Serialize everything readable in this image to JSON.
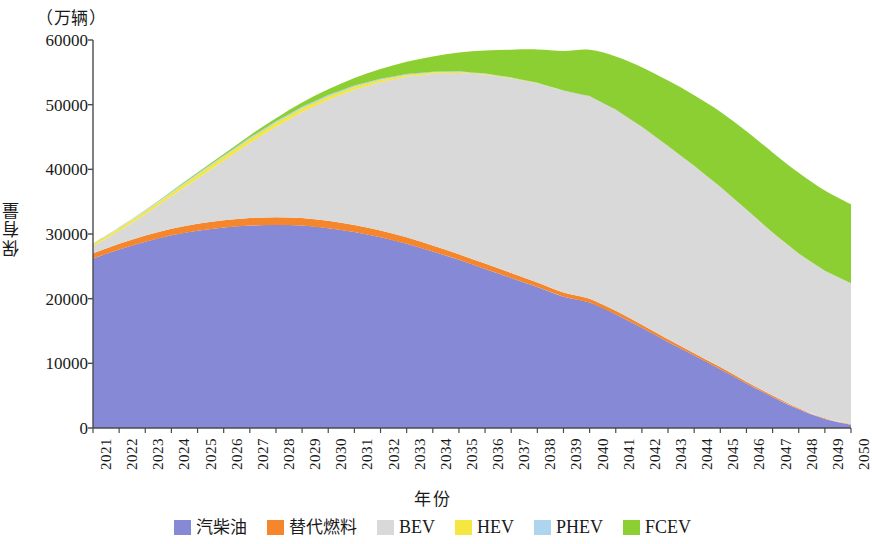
{
  "chart_data": {
    "type": "area",
    "stacked": true,
    "title": "",
    "unit_note": "（万辆）",
    "xlabel": "年份",
    "ylabel": "保有量",
    "ylim": [
      0,
      60000
    ],
    "ytick_labels": [
      "0",
      "10000",
      "20000",
      "30000",
      "40000",
      "50000",
      "60000"
    ],
    "ytick_values": [
      0,
      10000,
      20000,
      30000,
      40000,
      50000,
      60000
    ],
    "grid": false,
    "legend_position": "bottom",
    "categories": [
      "2021",
      "2022",
      "2023",
      "2024",
      "2025",
      "2026",
      "2027",
      "2028",
      "2029",
      "2030",
      "2031",
      "2032",
      "2033",
      "2034",
      "2035",
      "2036",
      "2037",
      "2038",
      "2039",
      "2040",
      "2041",
      "2042",
      "2043",
      "2044",
      "2045",
      "2046",
      "2047",
      "2048",
      "2049",
      "2050"
    ],
    "series": [
      {
        "name": "汽柴油",
        "color": "#8689d6",
        "values": [
          26200,
          27600,
          28800,
          29800,
          30500,
          31000,
          31300,
          31400,
          31300,
          30900,
          30300,
          29500,
          28500,
          27300,
          26000,
          24600,
          23200,
          21800,
          20300,
          19400,
          17600,
          15500,
          13300,
          11200,
          9100,
          6900,
          4800,
          2900,
          1400,
          500
        ]
      },
      {
        "name": "替代燃料",
        "color": "#f5862b",
        "values": [
          800,
          880,
          950,
          1020,
          1080,
          1130,
          1170,
          1190,
          1180,
          1150,
          1110,
          1060,
          1000,
          940,
          880,
          820,
          760,
          700,
          640,
          600,
          540,
          480,
          420,
          370,
          320,
          270,
          220,
          170,
          120,
          90
        ]
      },
      {
        "name": "BEV",
        "color": "#d9d9d9",
        "values": [
          1100,
          2000,
          3300,
          5000,
          7000,
          9200,
          11600,
          14000,
          16400,
          18700,
          20900,
          22900,
          24800,
          26500,
          28000,
          29200,
          30100,
          30800,
          31200,
          31300,
          31100,
          30600,
          29900,
          29000,
          27900,
          26600,
          25200,
          23900,
          22800,
          21800
        ]
      },
      {
        "name": "HEV",
        "color": "#f5e642",
        "values": [
          350,
          420,
          480,
          530,
          570,
          600,
          610,
          600,
          570,
          520,
          450,
          380,
          300,
          230,
          170,
          120,
          80,
          50,
          30,
          20,
          10,
          5,
          0,
          0,
          0,
          0,
          0,
          0,
          0,
          0
        ]
      },
      {
        "name": "PHEV",
        "color": "#aed5f0",
        "values": [
          90,
          120,
          150,
          180,
          200,
          215,
          225,
          230,
          225,
          215,
          200,
          180,
          155,
          130,
          105,
          80,
          60,
          40,
          25,
          15,
          8,
          4,
          0,
          0,
          0,
          0,
          0,
          0,
          0,
          0
        ]
      },
      {
        "name": "FCEV",
        "color": "#8ccf32",
        "values": [
          10,
          25,
          50,
          90,
          150,
          230,
          340,
          480,
          660,
          880,
          1150,
          1480,
          1880,
          2350,
          2900,
          3550,
          4300,
          5150,
          6100,
          7150,
          8200,
          9200,
          10100,
          10900,
          11600,
          12100,
          12400,
          12500,
          12400,
          12200
        ]
      }
    ],
    "totals_note": "总保有量峰值约 54000 万辆（2041 年前后）"
  },
  "axis": {
    "y_unit": "（万辆）",
    "y_title": "保有量",
    "x_title": "年份"
  },
  "legend": {
    "items": [
      {
        "label": "汽柴油",
        "color": "#8689d6",
        "latin": false
      },
      {
        "label": "替代燃料",
        "color": "#f5862b",
        "latin": false
      },
      {
        "label": "BEV",
        "color": "#d9d9d9",
        "latin": true
      },
      {
        "label": "HEV",
        "color": "#f5e642",
        "latin": true
      },
      {
        "label": "PHEV",
        "color": "#aed5f0",
        "latin": true
      },
      {
        "label": "FCEV",
        "color": "#8ccf32",
        "latin": true
      }
    ]
  }
}
